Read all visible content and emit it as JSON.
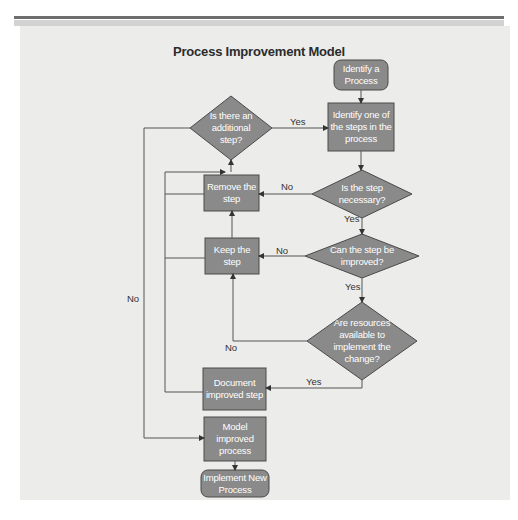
{
  "title": "Process Improvement Model",
  "nodes": {
    "identify_process": "Identify a Process",
    "identify_step": "Identify one of the steps in the process",
    "additional_step": "Is there an additional step?",
    "step_necessary": "Is the step necessary?",
    "remove_step": "Remove the step",
    "can_improve": "Can the step be improved?",
    "keep_step": "Keep the step",
    "resources_available": "Are resources available to implement the change?",
    "document_step": "Document improved step",
    "model_process": "Model improved process",
    "implement_process": "Implement New Process"
  },
  "edge_labels": {
    "additional_yes": "Yes",
    "necessary_no": "No",
    "necessary_yes": "Yes",
    "improve_no": "No",
    "improve_yes": "Yes",
    "resources_no": "No",
    "resources_yes": "Yes",
    "additional_no": "No"
  },
  "colors": {
    "shape_fill": "#8a8a8a",
    "shape_stroke": "#4a4a4a",
    "line": "#555555",
    "panel": "#ececeb"
  }
}
